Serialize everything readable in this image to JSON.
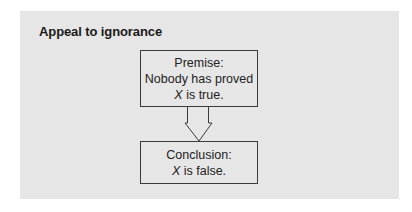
{
  "title": "Appeal to ignorance",
  "premise": {
    "label": "Premise:",
    "line1": "Nobody has proved",
    "line2_var": "X",
    "line2_rest": " is true."
  },
  "conclusion": {
    "label": "Conclusion:",
    "line1_var": "X",
    "line1_rest": " is false."
  },
  "arrow": {
    "direction": "down",
    "style": "hollow-block-arrow"
  },
  "colors": {
    "panel_bg": "#e6e6e6",
    "border": "#3a3a3a",
    "text": "#222222"
  }
}
